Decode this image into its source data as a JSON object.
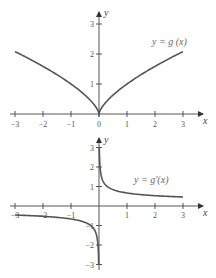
{
  "chart_data": [
    {
      "type": "line",
      "title": "",
      "annotation": "y = g (x)",
      "xlabel": "x",
      "ylabel": "y",
      "xlim": [
        -3,
        3
      ],
      "ylim": [
        0,
        3
      ],
      "x_ticks": [
        "−3",
        "−2",
        "−1",
        "0",
        "1",
        "2",
        "3"
      ],
      "y_ticks": [
        "1",
        "2",
        "3"
      ],
      "grid": false,
      "series": [
        {
          "name": "g(x)",
          "function": "|x|^(2/3)",
          "x": [
            -3,
            -2.5,
            -2,
            -1.5,
            -1,
            -0.5,
            -0.25,
            -0.1,
            0,
            0.1,
            0.25,
            0.5,
            1,
            1.5,
            2,
            2.5,
            3
          ],
          "y": [
            2.08,
            1.84,
            1.59,
            1.31,
            1.0,
            0.63,
            0.4,
            0.22,
            0,
            0.22,
            0.4,
            0.63,
            1.0,
            1.31,
            1.59,
            1.84,
            2.08
          ]
        }
      ]
    },
    {
      "type": "line",
      "title": "",
      "annotation": "y = g′(x)",
      "xlabel": "x",
      "ylabel": "y",
      "xlim": [
        -3,
        3
      ],
      "ylim": [
        -3,
        3
      ],
      "x_ticks": [
        "−3",
        "−2",
        "−1",
        "1",
        "2",
        "3"
      ],
      "y_ticks": [
        "−3",
        "−2",
        "−1",
        "1",
        "2",
        "3"
      ],
      "grid": false,
      "series": [
        {
          "name": "g'(x) right branch",
          "function": "(2/3)x^(-1/3)",
          "x": [
            0.011,
            0.02,
            0.05,
            0.1,
            0.25,
            0.5,
            1,
            1.5,
            2,
            2.5,
            3
          ],
          "y": [
            2.98,
            2.46,
            1.81,
            1.44,
            1.06,
            0.84,
            0.67,
            0.58,
            0.53,
            0.49,
            0.46
          ]
        },
        {
          "name": "g'(x) left branch",
          "function": "-(2/3)|x|^(-1/3)",
          "x": [
            -3,
            -2.5,
            -2,
            -1.5,
            -1,
            -0.5,
            -0.25,
            -0.1,
            -0.05,
            -0.02,
            -0.011
          ],
          "y": [
            -0.46,
            -0.49,
            -0.53,
            -0.58,
            -0.67,
            -0.84,
            -1.06,
            -1.44,
            -1.81,
            -2.46,
            -2.98
          ]
        }
      ]
    }
  ]
}
